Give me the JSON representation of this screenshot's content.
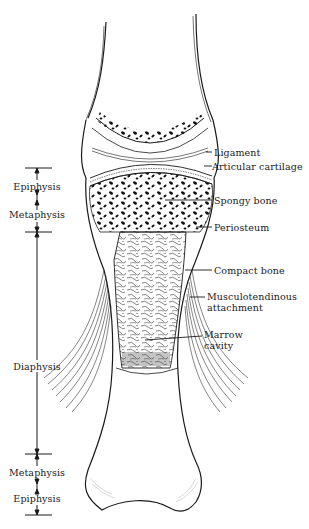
{
  "diagram": {
    "regions_left": [
      {
        "label": "Epiphysis"
      },
      {
        "label": "Metaphysis"
      },
      {
        "label": "Diaphysis"
      },
      {
        "label": "Metaphysis"
      },
      {
        "label": "Epiphysis"
      }
    ],
    "labels_right": [
      {
        "label": "Ligament"
      },
      {
        "label": "Articular cartilage"
      },
      {
        "label": "Spongy bone"
      },
      {
        "label": "Periosteum"
      },
      {
        "label": "Compact bone"
      },
      {
        "label": "Musculotendinous\nattachment"
      },
      {
        "label": "Marrow\ncavity"
      }
    ],
    "colors": {
      "ink": "#1a1a1a",
      "background": "#ffffff"
    }
  }
}
